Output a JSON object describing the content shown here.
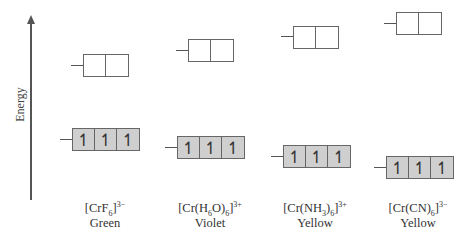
{
  "axis": {
    "label": "Energy"
  },
  "complexes": [
    {
      "formula_html": "[CrF<sub>6</sub>]<sup>3−</sup>",
      "color_name": "Green",
      "eg": {
        "x": 83,
        "y": 54,
        "tick_y": 65
      },
      "t2g": {
        "x": 72,
        "y": 128,
        "tick_y": 139
      },
      "label_x": 55
    },
    {
      "formula_html": "[Cr(H<sub>6</sub>O)<sub>6</sub>]<sup>3+</sup>",
      "color_name": "Violet",
      "eg": {
        "x": 188,
        "y": 39,
        "tick_y": 50
      },
      "t2g": {
        "x": 177,
        "y": 136,
        "tick_y": 147
      },
      "label_x": 160
    },
    {
      "formula_html": "[Cr(NH<sub>3</sub>)<sub>6</sub>]<sup>3+</sup>",
      "color_name": "Yellow",
      "eg": {
        "x": 293,
        "y": 26,
        "tick_y": 36
      },
      "t2g": {
        "x": 283,
        "y": 145,
        "tick_y": 156
      },
      "label_x": 265
    },
    {
      "formula_html": "[Cr(CN)<sub>6</sub>]<sup>3−</sup>",
      "color_name": "Yellow",
      "eg": {
        "x": 396,
        "y": 12,
        "tick_y": 23
      },
      "t2g": {
        "x": 386,
        "y": 156,
        "tick_y": 167
      },
      "label_x": 368
    }
  ],
  "eg_orbitals": 2,
  "t2g_orbitals": 3,
  "electron_symbol": "↿",
  "fill_color": "#cfcfcf"
}
